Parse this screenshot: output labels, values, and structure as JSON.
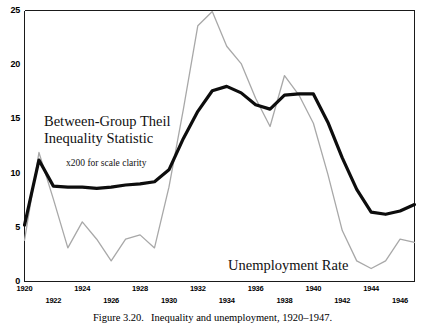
{
  "caption": {
    "figure_number": "Figure 3.20.",
    "text": "Inequality and unemployment, 1920–1947."
  },
  "annotations": {
    "theil_line1": "Between-Group Theil",
    "theil_line2": "Inequality Statistic",
    "scale_note": "x200 for scale clarity",
    "unemployment": "Unemployment Rate"
  },
  "colors": {
    "theil_series": "#0d0d0d",
    "unemployment_series": "#a8a8a8",
    "axis": "#1a1a1a",
    "background": "#ffffff"
  },
  "chart_data": {
    "type": "line",
    "title": "Inequality and unemployment, 1920–1947.",
    "xlabel": "",
    "ylabel": "",
    "xlim": [
      1920,
      1947
    ],
    "ylim": [
      0,
      25
    ],
    "grid": false,
    "legend": "inline-annotations",
    "ytick_labels": [
      "25",
      "20",
      "15",
      "10",
      "5",
      "0"
    ],
    "ytick_values": [
      25,
      20,
      15,
      10,
      5,
      0
    ],
    "xtick_labels": [
      "1920",
      "1922",
      "1924",
      "1926",
      "1928",
      "1930",
      "1932",
      "1934",
      "1936",
      "1938",
      "1940",
      "1942",
      "1944",
      "1946"
    ],
    "xtick_values": [
      1920,
      1922,
      1924,
      1926,
      1928,
      1930,
      1932,
      1934,
      1936,
      1938,
      1940,
      1942,
      1944,
      1946
    ],
    "x": [
      1920,
      1921,
      1922,
      1923,
      1924,
      1925,
      1926,
      1927,
      1928,
      1929,
      1930,
      1931,
      1932,
      1933,
      1934,
      1935,
      1936,
      1937,
      1938,
      1939,
      1940,
      1941,
      1942,
      1943,
      1944,
      1945,
      1946,
      1947
    ],
    "series": [
      {
        "name": "Between-Group Theil Inequality Statistic",
        "note": "x200 for scale clarity",
        "color": "#0d0d0d",
        "width": 3.2,
        "values": [
          5.2,
          11.2,
          8.8,
          8.7,
          8.7,
          8.6,
          8.7,
          8.9,
          9.0,
          9.2,
          10.3,
          13.2,
          15.7,
          17.6,
          18.0,
          17.4,
          16.3,
          15.9,
          17.2,
          17.3,
          17.3,
          14.7,
          11.4,
          8.5,
          6.4,
          6.2,
          6.5,
          7.1
        ]
      },
      {
        "name": "Unemployment Rate",
        "color": "#a8a8a8",
        "width": 1.3,
        "values": [
          3.8,
          11.9,
          7.6,
          3.1,
          5.5,
          3.9,
          1.9,
          3.9,
          4.3,
          3.1,
          8.7,
          15.9,
          23.6,
          24.9,
          21.7,
          20.1,
          16.9,
          14.3,
          19.0,
          17.2,
          14.6,
          9.9,
          4.7,
          1.9,
          1.2,
          1.9,
          3.9,
          3.6
        ]
      }
    ]
  }
}
